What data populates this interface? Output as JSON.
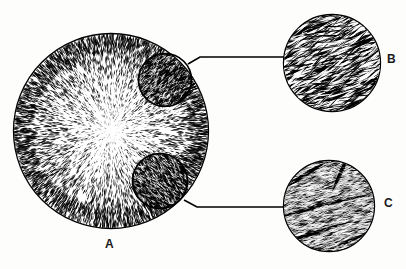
{
  "figure": {
    "type": "scientific-line-drawing",
    "background_color": "#ffffff",
    "ink_color": "#000000"
  },
  "panels": [
    {
      "id": "A",
      "label": "A",
      "name": "spherulite-overview",
      "shape": "circle",
      "center": [
        111,
        131
      ],
      "radius": 98,
      "texture": "radial-fibrous",
      "description": "large circle filled with fine needle-like fibers radiating outward from a central nucleus"
    },
    {
      "id": "B",
      "label": "B",
      "name": "inset-coarse-lath",
      "shape": "circle",
      "center": [
        332,
        63
      ],
      "radius": 49,
      "texture": "coarse-diagonal-laths",
      "description": "magnified view showing thick elongated black laths oriented diagonally"
    },
    {
      "id": "C",
      "label": "C",
      "name": "inset-fine-fiber",
      "shape": "circle",
      "center": [
        329,
        206
      ],
      "radius": 46,
      "texture": "fine-fiber-with-dark-bands",
      "description": "magnified view showing fine dense fibers crossed by thick dark bands"
    }
  ],
  "callout_regions": [
    {
      "name": "callout-circle-upper",
      "center": [
        165,
        80
      ],
      "radius": 27,
      "links_to": "B"
    },
    {
      "name": "callout-circle-lower",
      "center": [
        160,
        181
      ],
      "radius": 28,
      "links_to": "C"
    }
  ],
  "leader_lines": [
    {
      "name": "leader-line-b",
      "from": [
        188,
        64
      ],
      "to": [
        285,
        60
      ],
      "links": "A-to-B"
    },
    {
      "name": "leader-line-c",
      "from": [
        184,
        200
      ],
      "to": [
        284,
        207
      ],
      "links": "A-to-C"
    }
  ],
  "labels": {
    "a": "A",
    "b": "B",
    "c": "C"
  },
  "colors": {
    "ink": "#000000",
    "paper": "#ffffff",
    "label_text": "#1a1a1a"
  }
}
